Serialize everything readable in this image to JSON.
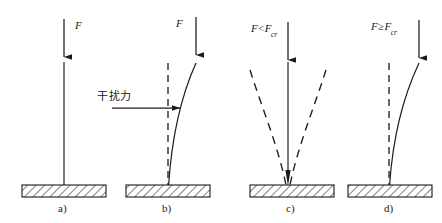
{
  "figure": {
    "background_color": "#ffffff",
    "line_color": "#1a1a1a",
    "hatch_color": "#1a1a1a",
    "panels": [
      {
        "id": "a",
        "caption": "a)",
        "force_label": "F",
        "force_label_plain": "F",
        "description": "straight unloaded column on fixed base",
        "column_state": "straight-solid",
        "has_disturbance_arrow": false,
        "has_dashed_reference": false,
        "has_dashed_curves": false
      },
      {
        "id": "b",
        "caption": "b)",
        "force_label": "F",
        "force_label_plain": "F",
        "disturbance_label": "干扰力",
        "description": "column deflected to the right by a lateral disturbance force",
        "column_state": "curved-solid",
        "has_disturbance_arrow": true,
        "has_dashed_reference": true,
        "has_dashed_curves": false
      },
      {
        "id": "c",
        "caption": "c)",
        "force_relation": "<",
        "force_symbol": "F",
        "force_critical_symbol": "F",
        "force_critical_subscript": "cr",
        "force_label_plain": "F<Fcr",
        "description": "stable equilibrium: column returns to straight, dashed curves show removed deflection",
        "column_state": "straight-solid",
        "has_disturbance_arrow": false,
        "has_dashed_reference": false,
        "has_dashed_curves": true
      },
      {
        "id": "d",
        "caption": "d)",
        "force_relation": "≥",
        "force_symbol": "F",
        "force_critical_symbol": "F",
        "force_critical_subscript": "cr",
        "force_label_plain": "F≥Fcr",
        "description": "unstable: column buckles and stays curved",
        "column_state": "curved-solid",
        "has_disturbance_arrow": false,
        "has_dashed_reference": true,
        "has_dashed_curves": false
      }
    ]
  }
}
